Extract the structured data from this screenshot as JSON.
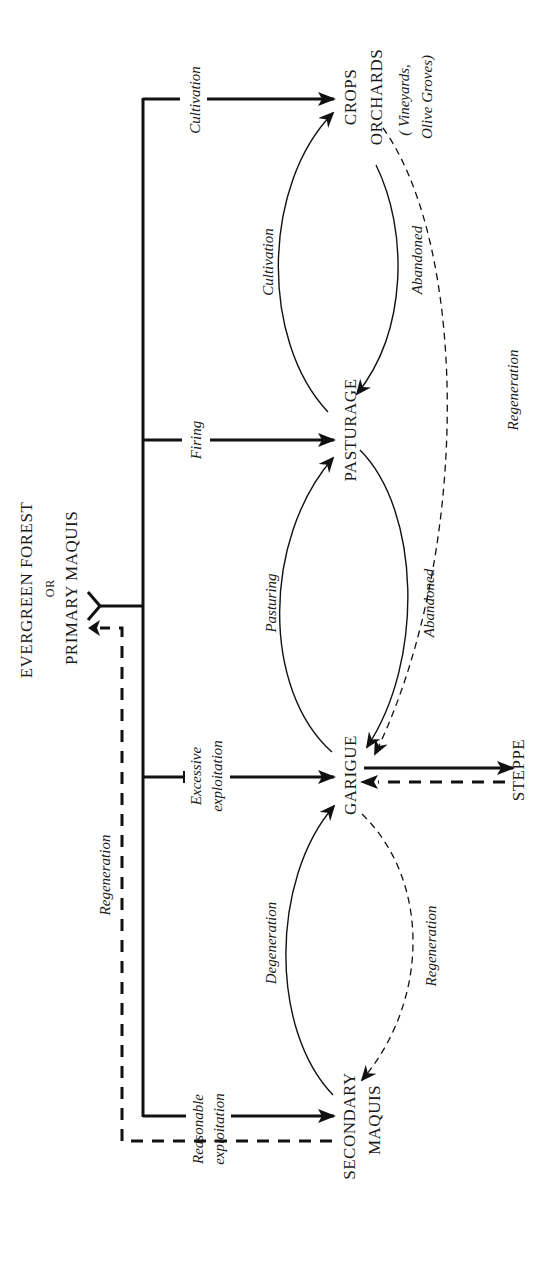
{
  "diagram": {
    "orientation": "rotated 90° counter-clockwise",
    "nodes": {
      "forest_line1": "EVERGREEN FOREST",
      "forest_or": "OR",
      "forest_line2": "PRIMARY MAQUIS",
      "crops": "CROPS",
      "orchards": "ORCHARDS",
      "orchards_note_1": "( Vineyards,",
      "orchards_note_2": "Olive Groves)",
      "pasturage": "PASTURAGE",
      "garigue": "GARIGUE",
      "steppe": "STEPPE",
      "secondary_1": "SECONDARY",
      "secondary_2": "MAQUIS"
    },
    "edge_labels": {
      "cultivation_main": "Cultivation",
      "firing": "Firing",
      "excessive_1": "Excessive",
      "excessive_2": "exploitation",
      "reasonable_1": "Reasonable",
      "reasonable_2": "exploitation",
      "regeneration_left": "Regeneration",
      "cultivation_arc": "Cultivation",
      "abandoned_top": "Abandoned",
      "pasturing": "Pasturing",
      "abandoned_mid": "Abandoned",
      "regeneration_long": "Regeneration",
      "degeneration": "Degeneration",
      "regeneration_bottom": "Regeneration"
    },
    "edges": [
      {
        "from": "Evergreen Forest",
        "to": "Crops/Orchards",
        "label": "Cultivation",
        "style": "solid"
      },
      {
        "from": "Evergreen Forest",
        "to": "Pasturage",
        "label": "Firing",
        "style": "solid"
      },
      {
        "from": "Evergreen Forest",
        "to": "Garigue",
        "label": "Excessive exploitation",
        "style": "solid"
      },
      {
        "from": "Evergreen Forest",
        "to": "Secondary Maquis",
        "label": "Reasonable exploitation",
        "style": "solid"
      },
      {
        "from": "Secondary Maquis",
        "to": "Evergreen Forest",
        "label": "Regeneration",
        "style": "dashed"
      },
      {
        "from": "Pasturage",
        "to": "Crops/Orchards",
        "label": "Cultivation",
        "style": "solid"
      },
      {
        "from": "Crops/Orchards",
        "to": "Pasturage",
        "label": "Abandoned",
        "style": "solid"
      },
      {
        "from": "Garigue",
        "to": "Pasturage",
        "label": "Pasturing",
        "style": "solid"
      },
      {
        "from": "Pasturage",
        "to": "Garigue",
        "label": "Abandoned",
        "style": "solid"
      },
      {
        "from": "Crops/Orchards",
        "to": "Garigue",
        "label": "Regeneration",
        "style": "dashed"
      },
      {
        "from": "Secondary Maquis",
        "to": "Garigue",
        "label": "Degeneration",
        "style": "solid"
      },
      {
        "from": "Garigue",
        "to": "Secondary Maquis",
        "label": "Regeneration",
        "style": "dashed"
      },
      {
        "from": "Garigue",
        "to": "Steppe",
        "label": "",
        "style": "solid"
      },
      {
        "from": "Steppe",
        "to": "Garigue",
        "label": "",
        "style": "dashed"
      }
    ]
  }
}
